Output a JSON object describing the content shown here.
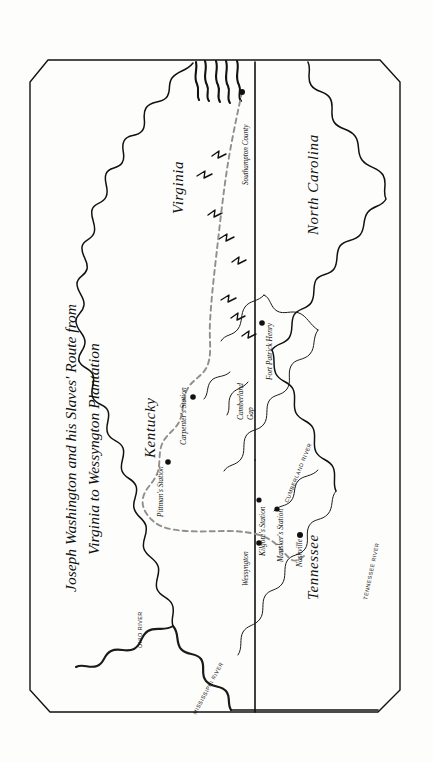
{
  "document": {
    "kind": "historical-route-map",
    "title_line_1": "Joseph Washington and his Slaves' Route from",
    "title_line_2": "Virginia to Wessyngton Plantation",
    "orientation_note": "map and all labels rendered rotated 90 degrees",
    "background_color": "#fdfdfb",
    "ink_color": "#111111",
    "route_color": "#8f8f8f"
  },
  "states": [
    {
      "id": "virginia",
      "label": "Virginia"
    },
    {
      "id": "north-carolina",
      "label": "North Carolina"
    },
    {
      "id": "kentucky",
      "label": "Kentucky"
    },
    {
      "id": "tennessee",
      "label": "Tennessee"
    }
  ],
  "places": [
    {
      "id": "southampton-county",
      "label": "Southampton County"
    },
    {
      "id": "fort-patrick-henry",
      "label": "Fort Patrick Henry"
    },
    {
      "id": "cumberland-gap",
      "label": "Cumberland Gap"
    },
    {
      "id": "carpenters-station",
      "label": "Carpenter's Station"
    },
    {
      "id": "pittmans-station",
      "label": "Pittman's Station"
    },
    {
      "id": "kilgores-station",
      "label": "Kilgore's Station"
    },
    {
      "id": "manskers-station",
      "label": "Mansker's Station"
    },
    {
      "id": "nashville",
      "label": "Nashville"
    },
    {
      "id": "wessyngton",
      "label": "Wessyngton"
    }
  ],
  "rivers": [
    {
      "id": "ohio-river",
      "label": "OHIO RIVER"
    },
    {
      "id": "mississippi-river",
      "label": "MISSISSIPPI RIVER"
    },
    {
      "id": "cumberland-river",
      "label": "CUMBERLAND RIVER"
    },
    {
      "id": "tennessee-river",
      "label": "TENNESSEE RIVER"
    }
  ],
  "legend_symbols": [
    {
      "id": "route-dashed-line",
      "meaning": "travel route"
    },
    {
      "id": "settlement-dot",
      "meaning": "station or town"
    },
    {
      "id": "mountain-chevron",
      "meaning": "Appalachian mountains"
    },
    {
      "id": "coast-hatch",
      "meaning": "Atlantic coastline"
    }
  ]
}
